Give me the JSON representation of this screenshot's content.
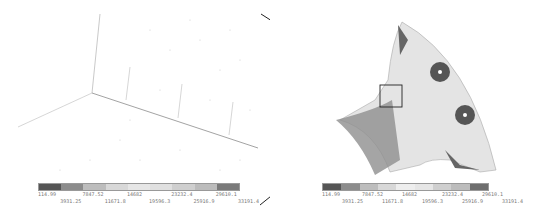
{
  "figure": {
    "left_panel": {
      "description": "zoomed mesh detail",
      "legend": {
        "colors": [
          "#555555",
          "#8c8c8c",
          "#bdbdbd",
          "#d8d8d8",
          "#e6e6e6",
          "#e0e0e0",
          "#cfcfcf",
          "#bcbcbc",
          "#7a7a7a"
        ],
        "labels_top": [
          "114.99",
          "7847.52",
          "14682",
          "23232.4",
          "29610.1"
        ],
        "labels_bottom": [
          "3931.25",
          "11671.8",
          "19596.3",
          "25916.9",
          "33191.4"
        ]
      }
    },
    "right_panel": {
      "description": "FE stress contour on quarter flange part",
      "legend": {
        "colors": [
          "#555555",
          "#8c8c8c",
          "#bdbdbd",
          "#d8d8d8",
          "#eeeeee",
          "#e6e6e6",
          "#cfcfcf",
          "#bcbcbc",
          "#6e6e6e"
        ],
        "labels_top": [
          "114.99",
          "7847.52",
          "14682",
          "23232.4",
          "29610.1"
        ],
        "labels_bottom": [
          "3931.25",
          "11671.8",
          "19596.3",
          "25916.9",
          "33191.4"
        ]
      }
    }
  }
}
